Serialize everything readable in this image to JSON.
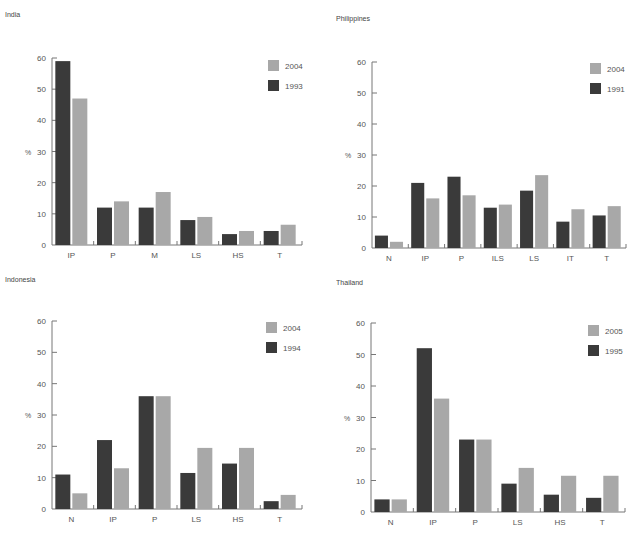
{
  "colors": {
    "dark": "#3a3a3a",
    "light": "#a8a8a8",
    "axis": "#777777"
  },
  "chart_data": [
    {
      "type": "bar",
      "title": "India",
      "xlabel": "",
      "ylabel": "%",
      "ylim": [
        0,
        60
      ],
      "yticks": [
        0,
        10,
        20,
        30,
        40,
        50,
        60
      ],
      "grid": false,
      "legend_position": "top-right",
      "categories": [
        "IP",
        "P",
        "M",
        "LS",
        "HS",
        "T"
      ],
      "series": [
        {
          "name": "1993",
          "color": "dark",
          "values": [
            59,
            12,
            12,
            8,
            3.5,
            4.5
          ]
        },
        {
          "name": "2004",
          "color": "light",
          "values": [
            47,
            14,
            17,
            9,
            4.5,
            6.5
          ]
        }
      ],
      "legend": [
        "2004",
        "1993"
      ]
    },
    {
      "type": "bar",
      "title": "Philippines",
      "xlabel": "",
      "ylabel": "%",
      "ylim": [
        0,
        60
      ],
      "yticks": [
        0,
        10,
        20,
        30,
        40,
        50,
        60
      ],
      "grid": false,
      "legend_position": "top-right",
      "categories": [
        "N",
        "IP",
        "P",
        "ILS",
        "LS",
        "IT",
        "T"
      ],
      "series": [
        {
          "name": "1991",
          "color": "dark",
          "values": [
            4,
            21,
            23,
            13,
            18.5,
            8.5,
            10.5
          ]
        },
        {
          "name": "2004",
          "color": "light",
          "values": [
            2,
            16,
            17,
            14,
            23.5,
            12.5,
            13.5
          ]
        }
      ],
      "legend": [
        "2004",
        "1991"
      ]
    },
    {
      "type": "bar",
      "title": "Indonesia",
      "xlabel": "",
      "ylabel": "%",
      "ylim": [
        0,
        60
      ],
      "yticks": [
        0,
        10,
        20,
        30,
        40,
        50,
        60
      ],
      "grid": false,
      "legend_position": "top-right",
      "categories": [
        "N",
        "IP",
        "P",
        "LS",
        "HS",
        "T"
      ],
      "series": [
        {
          "name": "1994",
          "color": "dark",
          "values": [
            11,
            22,
            36,
            11.5,
            14.5,
            2.5
          ]
        },
        {
          "name": "2004",
          "color": "light",
          "values": [
            5,
            13,
            36,
            19.5,
            19.5,
            4.5
          ]
        }
      ],
      "legend": [
        "2004",
        "1994"
      ]
    },
    {
      "type": "bar",
      "title": "Thailand",
      "xlabel": "",
      "ylabel": "%",
      "ylim": [
        0,
        60
      ],
      "yticks": [
        0,
        10,
        20,
        30,
        40,
        50,
        60
      ],
      "grid": false,
      "legend_position": "top-right",
      "categories": [
        "N",
        "IP",
        "P",
        "LS",
        "HS",
        "T"
      ],
      "series": [
        {
          "name": "1995",
          "color": "dark",
          "values": [
            4,
            52,
            23,
            9,
            5.5,
            4.5
          ]
        },
        {
          "name": "2005",
          "color": "light",
          "values": [
            4,
            36,
            23,
            14,
            11.5,
            11.5
          ]
        }
      ],
      "legend": [
        "2005",
        "1995"
      ]
    }
  ],
  "layout": [
    {
      "title_x": 5,
      "title_y": 18,
      "axis_x": 52,
      "top_y": 58,
      "base_y": 245,
      "end_x": 302,
      "legend_x": 268,
      "legend_y": 60
    },
    {
      "title_x": 336,
      "title_y": 22,
      "axis_x": 372,
      "top_y": 62,
      "base_y": 248,
      "end_x": 626,
      "legend_x": 590,
      "legend_y": 63
    },
    {
      "title_x": 5,
      "title_y": 283,
      "axis_x": 52,
      "top_y": 321,
      "base_y": 509,
      "end_x": 302,
      "legend_x": 266,
      "legend_y": 322
    },
    {
      "title_x": 336,
      "title_y": 286,
      "axis_x": 371,
      "top_y": 323,
      "base_y": 512,
      "end_x": 625,
      "legend_x": 588,
      "legend_y": 325
    }
  ]
}
